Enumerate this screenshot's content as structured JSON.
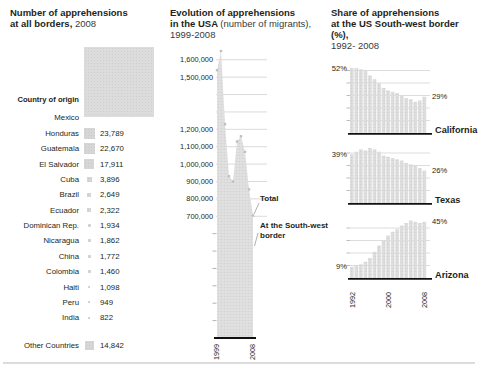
{
  "page": {
    "background": "#ffffff",
    "text_color": "#231f20",
    "bar_color": "#dcdcdc",
    "halftone_dot_color": "#cdcdcd",
    "marker_color": "#bfbfbf",
    "grid_color": "#d6d6d6",
    "axis_color": "#111111"
  },
  "left_panel": {
    "title_bold_1": "Number of apprehensions",
    "title_bold_2": "at all borders,",
    "title_year": "2008",
    "axis_label": "Country of origin",
    "mexico_label": "Mexico"
  },
  "middle_panel": {
    "title_bold_1": "Evolution of apprehensions",
    "title_bold_2": "in the USA",
    "title_regular_2": "(number of migrants),",
    "title_line_3": "1999-2008",
    "callout_total": "Total",
    "callout_sw": "At the South-west border"
  },
  "right_panel": {
    "title_bold_1": "Share of apprehensions",
    "title_bold_2": "at the US South-west border (%),",
    "title_line_3": "1992- 2008"
  },
  "chart_data": [
    {
      "id": "apprehensions_by_country",
      "type": "bar",
      "title": "Number of apprehensions at all borders, 2008",
      "xlabel": "Country of origin",
      "encoding": "square-area",
      "categories": [
        "Mexico",
        "Honduras",
        "Guatemala",
        "El Salvador",
        "Cuba",
        "Brazil",
        "Ecuador",
        "Dominican Rep.",
        "Nicaragua",
        "China",
        "Colombia",
        "Haiti",
        "Peru",
        "India",
        "Other Countries"
      ],
      "values": [
        null,
        23789,
        22670,
        17911,
        3896,
        2649,
        2322,
        1934,
        1862,
        1772,
        1460,
        1098,
        949,
        822,
        14842
      ]
    },
    {
      "id": "evolution_usa",
      "type": "area",
      "title": "Evolution of apprehensions in the USA (number of migrants), 1999-2008",
      "x": [
        1999,
        2000,
        2001,
        2002,
        2003,
        2004,
        2005,
        2006,
        2007,
        2008
      ],
      "series": [
        {
          "name": "Total",
          "marker": "square-dot",
          "values": [
            1540000,
            1650000,
            1230000,
            930000,
            900000,
            1130000,
            1160000,
            1070000,
            855000,
            705000
          ]
        },
        {
          "name": "At the South-west border",
          "marker": "area",
          "values": [
            1540000,
            1650000,
            1230000,
            930000,
            900000,
            1130000,
            1160000,
            1070000,
            855000,
            705000
          ]
        }
      ],
      "ylim": [
        0,
        1700000
      ],
      "y_tick_labels": [
        "1,600,000",
        "1,500,000",
        "1,200,000",
        "1,100,000",
        "1,000,000",
        "900,000",
        "800,000",
        "700,000"
      ],
      "y_tick_values": [
        1600000,
        1500000,
        1200000,
        1100000,
        1000000,
        900000,
        800000,
        700000
      ],
      "unlabeled_gridlines": [
        1400000,
        1300000
      ],
      "minor_ticks": [
        600000,
        500000,
        400000,
        300000,
        200000,
        100000
      ],
      "x_axis_labels": [
        "1999",
        "2008"
      ],
      "grid": true,
      "legend_position": "callouts-right"
    },
    {
      "id": "sw_border_share",
      "type": "bar",
      "title": "Share of apprehensions at the US South-west border (%), 1992- 2008",
      "x_start": 1992,
      "x_end": 2008,
      "x_tick_labels": [
        "1992",
        "2000",
        "2008"
      ],
      "ylabel": "%",
      "series": [
        {
          "name": "California",
          "first_label": "52%",
          "last_label": "29%",
          "values": [
            52,
            52,
            51,
            50,
            46,
            43,
            40,
            36,
            34,
            33,
            32,
            30,
            28,
            27,
            25,
            26,
            29
          ]
        },
        {
          "name": "Texas",
          "first_label": "39%",
          "last_label": "26%",
          "values": [
            39,
            41,
            43,
            42,
            44,
            43,
            41,
            38,
            37,
            36,
            35,
            34,
            32,
            31,
            30,
            28,
            26
          ]
        },
        {
          "name": "Arizona",
          "first_label": "9%",
          "last_label": "45%",
          "values": [
            9,
            10,
            11,
            13,
            16,
            21,
            26,
            30,
            34,
            37,
            39,
            42,
            44,
            46,
            45,
            44,
            45
          ]
        }
      ]
    }
  ]
}
